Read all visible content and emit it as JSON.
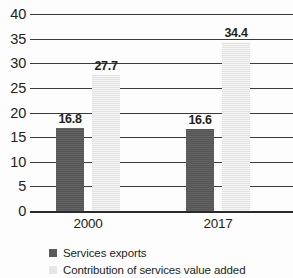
{
  "chart_data": {
    "type": "bar",
    "title": "",
    "subtitle": "",
    "xlabel": "",
    "ylabel": "",
    "categories": [
      "2000",
      "2017"
    ],
    "series": [
      {
        "name": "Services exports",
        "color": "#5a5a5a",
        "values": [
          16.8,
          16.6
        ],
        "value_labels": [
          "16.8",
          "16.6"
        ]
      },
      {
        "name": "Contribution of services value added",
        "color": "#e9e9e9",
        "values": [
          27.7,
          34.4
        ],
        "value_labels": [
          "27.7",
          "34.4"
        ]
      }
    ],
    "ylim": [
      0,
      40
    ],
    "yticks": [
      0,
      5,
      10,
      15,
      20,
      25,
      30,
      35,
      40
    ],
    "ytick_labels": [
      "0",
      "5",
      "10",
      "15",
      "20",
      "25",
      "30",
      "35",
      "40"
    ],
    "grid": true,
    "grid_axis": "y",
    "legend_position": "bottom-left",
    "legend": [
      "Services exports",
      "Contribution of services value added"
    ]
  }
}
